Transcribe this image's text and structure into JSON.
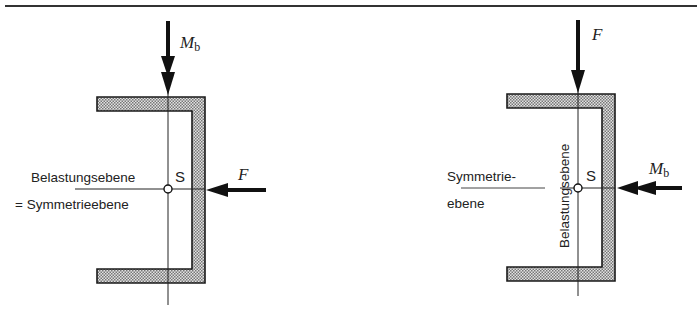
{
  "figure": {
    "left_panel": {
      "vertical_arrow_label": "M",
      "vertical_arrow_label_sub": "b",
      "horizontal_arrow_label": "F",
      "centroid_label": "S",
      "plane_label_line1": "Belastungsebene",
      "plane_label_line2": "= Symmetrieebene"
    },
    "right_panel": {
      "vertical_arrow_label": "F",
      "horizontal_arrow_label": "M",
      "horizontal_arrow_label_sub": "b",
      "centroid_label": "S",
      "symmetry_label_line1": "Symmetrie-",
      "symmetry_label_line2": "ebene",
      "load_plane_label": "Belastungsebene"
    },
    "colors": {
      "ink": "#1a1a1a",
      "hatch_fill": "#b9b9b9",
      "background": "#ffffff"
    }
  }
}
